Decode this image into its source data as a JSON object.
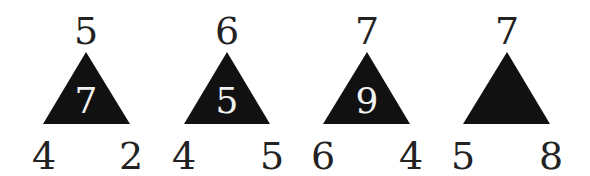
{
  "puzzle": {
    "colors": {
      "triangle_fill": "#111111",
      "number": "#222222",
      "inner_number": "#f2f2f2",
      "background": "#ffffff"
    },
    "triangles": [
      {
        "top": "5",
        "left": "4",
        "right": "2",
        "center": "7"
      },
      {
        "top": "6",
        "left": "4",
        "right": "5",
        "center": "5"
      },
      {
        "top": "7",
        "left": "6",
        "right": "4",
        "center": "9"
      },
      {
        "top": "7",
        "left": "5",
        "right": "8",
        "center": ""
      }
    ]
  }
}
